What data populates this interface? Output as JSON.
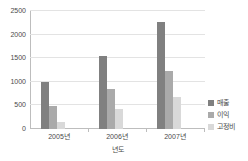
{
  "chart_data": {
    "type": "bar",
    "title": "",
    "xlabel": "년도",
    "ylabel": "",
    "categories": [
      "2005년",
      "2006년",
      "2007년"
    ],
    "series": [
      {
        "name": "매출",
        "values": [
          1000,
          1550,
          2270
        ],
        "color": "#808080"
      },
      {
        "name": "이익",
        "values": [
          490,
          850,
          1230
        ],
        "color": "#aaaaaa"
      },
      {
        "name": "고정비",
        "values": [
          140,
          420,
          680
        ],
        "color": "#d9d9d9"
      }
    ],
    "ylim": [
      0,
      2500
    ],
    "ytick_labels": [
      "0",
      "500",
      "1000",
      "1500",
      "2000",
      "2500"
    ],
    "ytick_values": [
      0,
      500,
      1000,
      1500,
      2000,
      2500
    ],
    "grid": true,
    "legend_position": "right"
  },
  "legend": {
    "items": [
      {
        "label": "매출"
      },
      {
        "label": "이익"
      },
      {
        "label": "고정비"
      }
    ]
  },
  "axes": {
    "x_title": "년도"
  }
}
